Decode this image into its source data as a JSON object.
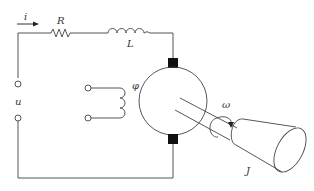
{
  "diagram": {
    "type": "dc-motor-equivalent-circuit",
    "labels": {
      "current": "i",
      "resistor": "R",
      "inductor": "L",
      "voltage": "u",
      "flux": "φ",
      "angular_velocity": "ω",
      "inertia": "J"
    },
    "colors": {
      "line": "#555555",
      "brush": "#111111",
      "text": "#333333",
      "background": "#ffffff"
    }
  }
}
